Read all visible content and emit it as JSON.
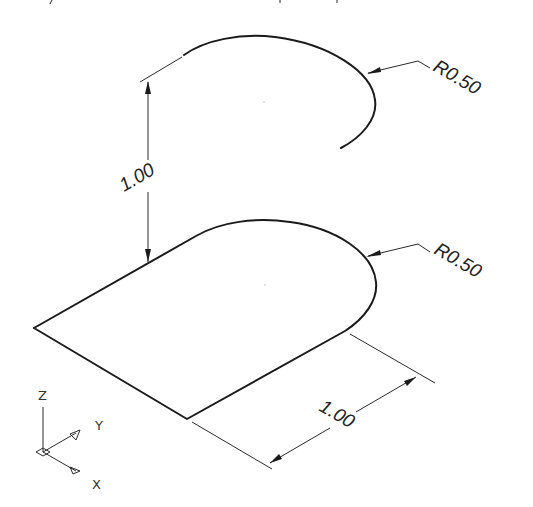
{
  "dimensions": {
    "vertical_height": "1.00",
    "upper_arc_radius": "R0.50",
    "lower_arc_radius": "R0.50",
    "bottom_length": "1.00"
  },
  "ucs_icon": {
    "z_label": "Z",
    "y_label": "Y",
    "x_label": "X"
  },
  "colors": {
    "line": "#1a1a1a",
    "background": "#ffffff"
  }
}
